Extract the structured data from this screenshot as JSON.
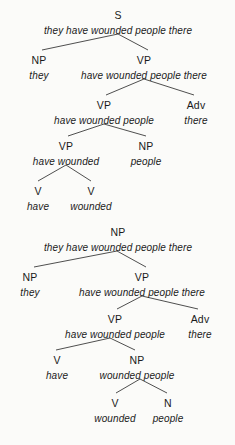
{
  "figure": {
    "type": "syntax-tree-diagram",
    "background_color": "#fbfbf9",
    "line_color": "#3b3b3b",
    "text_color": "#1a1a1a",
    "sentence": "they have wounded people there",
    "trees": [
      {
        "id": "tree-1",
        "root_category": "S",
        "nodes": [
          {
            "id": "t1-n0",
            "category": "S",
            "phrase": "they have wounded people there",
            "x": 118,
            "y_cat": 10,
            "y_phrase": 26
          },
          {
            "id": "t1-n1",
            "category": "NP",
            "phrase": "they",
            "x": 39,
            "y_cat": 55,
            "y_phrase": 71
          },
          {
            "id": "t1-n2",
            "category": "VP",
            "phrase": "have wounded people there",
            "x": 144,
            "y_cat": 55,
            "y_phrase": 71
          },
          {
            "id": "t1-n3",
            "category": "VP",
            "phrase": "have wounded people",
            "x": 104,
            "y_cat": 100,
            "y_phrase": 116
          },
          {
            "id": "t1-n4",
            "category": "Adv",
            "phrase": "there",
            "x": 196,
            "y_cat": 100,
            "y_phrase": 116
          },
          {
            "id": "t1-n5",
            "category": "VP",
            "phrase": "have wounded",
            "x": 66,
            "y_cat": 141,
            "y_phrase": 157
          },
          {
            "id": "t1-n6",
            "category": "NP",
            "phrase": "people",
            "x": 146,
            "y_cat": 141,
            "y_phrase": 157
          },
          {
            "id": "t1-n7",
            "category": "V",
            "phrase": "have",
            "x": 38,
            "y_cat": 186,
            "y_phrase": 202
          },
          {
            "id": "t1-n8",
            "category": "V",
            "phrase": "wounded",
            "x": 91,
            "y_cat": 186,
            "y_phrase": 202
          }
        ],
        "edges": [
          {
            "from": "t1-n0",
            "to": "t1-n1",
            "x1": 118,
            "y1": 34,
            "x2": 42,
            "y2": 50
          },
          {
            "from": "t1-n0",
            "to": "t1-n2",
            "x1": 118,
            "y1": 34,
            "x2": 148,
            "y2": 50
          },
          {
            "from": "t1-n2",
            "to": "t1-n3",
            "x1": 144,
            "y1": 79,
            "x2": 106,
            "y2": 95
          },
          {
            "from": "t1-n2",
            "to": "t1-n4",
            "x1": 144,
            "y1": 79,
            "x2": 194,
            "y2": 95
          },
          {
            "from": "t1-n3",
            "to": "t1-n5",
            "x1": 104,
            "y1": 124,
            "x2": 68,
            "y2": 136
          },
          {
            "from": "t1-n3",
            "to": "t1-n6",
            "x1": 104,
            "y1": 124,
            "x2": 146,
            "y2": 136
          },
          {
            "from": "t1-n5",
            "to": "t1-n7",
            "x1": 66,
            "y1": 165,
            "x2": 38,
            "y2": 181
          },
          {
            "from": "t1-n5",
            "to": "t1-n8",
            "x1": 66,
            "y1": 165,
            "x2": 91,
            "y2": 181
          }
        ]
      },
      {
        "id": "tree-2",
        "root_category": "NP",
        "nodes": [
          {
            "id": "t2-n0",
            "category": "NP",
            "phrase": "they have wounded people there",
            "x": 118,
            "y_cat": 227,
            "y_phrase": 243
          },
          {
            "id": "t2-n1",
            "category": "NP",
            "phrase": "they",
            "x": 30,
            "y_cat": 272,
            "y_phrase": 288
          },
          {
            "id": "t2-n2",
            "category": "VP",
            "phrase": "have wounded people there",
            "x": 142,
            "y_cat": 272,
            "y_phrase": 288
          },
          {
            "id": "t2-n3",
            "category": "VP",
            "phrase": "have wounded people",
            "x": 115,
            "y_cat": 314,
            "y_phrase": 330
          },
          {
            "id": "t2-n4",
            "category": "Adv",
            "phrase": "there",
            "x": 200,
            "y_cat": 314,
            "y_phrase": 330
          },
          {
            "id": "t2-n5",
            "category": "V",
            "phrase": "have",
            "x": 57,
            "y_cat": 355,
            "y_phrase": 371
          },
          {
            "id": "t2-n6",
            "category": "NP",
            "phrase": "wounded people",
            "x": 137,
            "y_cat": 355,
            "y_phrase": 371
          },
          {
            "id": "t2-n7",
            "category": "V",
            "phrase": "wounded",
            "x": 115,
            "y_cat": 398,
            "y_phrase": 414
          },
          {
            "id": "t2-n8",
            "category": "N",
            "phrase": "people",
            "x": 168,
            "y_cat": 398,
            "y_phrase": 414
          }
        ],
        "edges": [
          {
            "from": "t2-n0",
            "to": "t2-n1",
            "x1": 117,
            "y1": 251,
            "x2": 34,
            "y2": 267
          },
          {
            "from": "t2-n0",
            "to": "t2-n2",
            "x1": 117,
            "y1": 251,
            "x2": 146,
            "y2": 267
          },
          {
            "from": "t2-n2",
            "to": "t2-n3",
            "x1": 142,
            "y1": 296,
            "x2": 117,
            "y2": 309
          },
          {
            "from": "t2-n2",
            "to": "t2-n4",
            "x1": 142,
            "y1": 296,
            "x2": 198,
            "y2": 309
          },
          {
            "from": "t2-n3",
            "to": "t2-n5",
            "x1": 110,
            "y1": 338,
            "x2": 56,
            "y2": 350
          },
          {
            "from": "t2-n3",
            "to": "t2-n6",
            "x1": 110,
            "y1": 338,
            "x2": 135,
            "y2": 350
          },
          {
            "from": "t2-n6",
            "to": "t2-n7",
            "x1": 140,
            "y1": 379,
            "x2": 116,
            "y2": 393
          },
          {
            "from": "t2-n6",
            "to": "t2-n8",
            "x1": 140,
            "y1": 379,
            "x2": 167,
            "y2": 393
          }
        ]
      }
    ]
  }
}
